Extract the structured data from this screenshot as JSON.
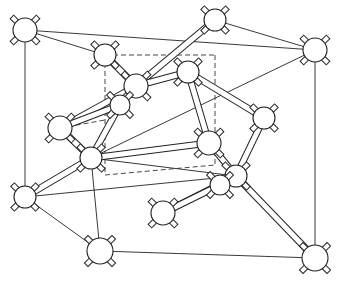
{
  "figure": {
    "title": "Diamond cubic crystal structure",
    "colors": {
      "line": "#222222",
      "background": "#ffffff",
      "atom_fill": "#ffffff"
    }
  },
  "cube": {
    "outer": {
      "front": [
        [
          25,
          30
        ],
        [
          315,
          50
        ],
        [
          315,
          258
        ],
        [
          25,
          197
        ]
      ],
      "back": [
        [
          100,
          55
        ],
        [
          215,
          20
        ],
        [
          264,
          118
        ]
      ]
    },
    "edges": [
      [
        [
          25,
          30
        ],
        [
          315,
          50
        ]
      ],
      [
        [
          25,
          30
        ],
        [
          25,
          197
        ]
      ],
      [
        [
          315,
          50
        ],
        [
          315,
          258
        ]
      ],
      [
        [
          25,
          197
        ],
        [
          100,
          251
        ]
      ],
      [
        [
          100,
          251
        ],
        [
          315,
          258
        ]
      ],
      [
        [
          25,
          30
        ],
        [
          105,
          55
        ]
      ],
      [
        [
          215,
          20
        ],
        [
          315,
          50
        ]
      ],
      [
        [
          91,
          158
        ],
        [
          236,
          176
        ]
      ],
      [
        [
          25,
          197
        ],
        [
          236,
          176
        ]
      ],
      [
        [
          236,
          176
        ],
        [
          315,
          258
        ]
      ],
      [
        [
          100,
          251
        ],
        [
          91,
          158
        ]
      ],
      [
        [
          91,
          158
        ],
        [
          315,
          50
        ]
      ]
    ],
    "hidden_edges": [
      [
        [
          105,
          55
        ],
        [
          215,
          55
        ]
      ],
      [
        [
          105,
          55
        ],
        [
          105,
          175
        ]
      ],
      [
        [
          215,
          55
        ],
        [
          215,
          165
        ]
      ],
      [
        [
          105,
          175
        ],
        [
          215,
          165
        ]
      ],
      [
        [
          60,
          128
        ],
        [
          105,
          120
        ]
      ]
    ]
  },
  "atoms": [
    {
      "id": "a1",
      "x": 25,
      "y": 30,
      "r": 12
    },
    {
      "id": "a2",
      "x": 215,
      "y": 20,
      "r": 11
    },
    {
      "id": "a3",
      "x": 315,
      "y": 50,
      "r": 12
    },
    {
      "id": "a4",
      "x": 105,
      "y": 55,
      "r": 11
    },
    {
      "id": "a5",
      "x": 166,
      "y": 35,
      "r": 0
    },
    {
      "id": "a6",
      "x": 136,
      "y": 86,
      "r": 12
    },
    {
      "id": "a7",
      "x": 188,
      "y": 72,
      "r": 11
    },
    {
      "id": "a8",
      "x": 120,
      "y": 105,
      "r": 10
    },
    {
      "id": "a9",
      "x": 60,
      "y": 128,
      "r": 12
    },
    {
      "id": "a10",
      "x": 91,
      "y": 158,
      "r": 11
    },
    {
      "id": "a11",
      "x": 264,
      "y": 118,
      "r": 11
    },
    {
      "id": "a12",
      "x": 209,
      "y": 143,
      "r": 12
    },
    {
      "id": "a13",
      "x": 236,
      "y": 176,
      "r": 11
    },
    {
      "id": "a14",
      "x": 220,
      "y": 185,
      "r": 10
    },
    {
      "id": "a15",
      "x": 25,
      "y": 197,
      "r": 11
    },
    {
      "id": "a16",
      "x": 163,
      "y": 213,
      "r": 12
    },
    {
      "id": "a17",
      "x": 100,
      "y": 251,
      "r": 13
    },
    {
      "id": "a18",
      "x": 315,
      "y": 258,
      "r": 13
    }
  ],
  "bonds": [
    [
      "a4",
      "a6"
    ],
    [
      "a2",
      "a6"
    ],
    [
      "a6",
      "a7"
    ],
    [
      "a6",
      "a9"
    ],
    [
      "a7",
      "a12"
    ],
    [
      "a7",
      "a11"
    ],
    [
      "a8",
      "a10"
    ],
    [
      "a9",
      "a8"
    ],
    [
      "a10",
      "a15"
    ],
    [
      "a10",
      "a12"
    ],
    [
      "a11",
      "a13"
    ],
    [
      "a12",
      "a13"
    ],
    [
      "a13",
      "a18"
    ],
    [
      "a13",
      "a16"
    ],
    [
      "a14",
      "a16"
    ],
    [
      "a10",
      "a9"
    ]
  ]
}
